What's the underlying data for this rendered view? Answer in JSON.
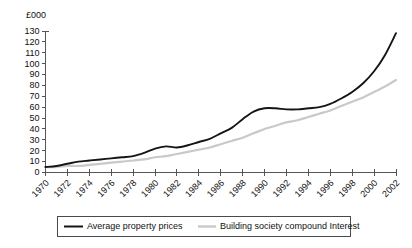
{
  "chart_data": {
    "type": "line",
    "title": "",
    "subtitle": "",
    "xlabel": "",
    "ylabel": "",
    "unit_label": "£000",
    "grid": false,
    "legend_position": "bottom",
    "xlim": [
      1970,
      2002
    ],
    "ylim": [
      0,
      130
    ],
    "ytick_step": 10,
    "xtick_step": 2,
    "x": [
      1970,
      1971,
      1972,
      1973,
      1974,
      1975,
      1976,
      1977,
      1978,
      1979,
      1980,
      1981,
      1982,
      1983,
      1984,
      1985,
      1986,
      1987,
      1988,
      1989,
      1990,
      1991,
      1992,
      1993,
      1994,
      1995,
      1996,
      1997,
      1998,
      1999,
      2000,
      2001,
      2002
    ],
    "xticks": [
      "1970",
      "1972",
      "1974",
      "1976",
      "1978",
      "1980",
      "1982",
      "1984",
      "1986",
      "1988",
      "1990",
      "1992",
      "1994",
      "1996",
      "1998",
      "2000",
      "2002"
    ],
    "yticks": [
      "0",
      "10",
      "20",
      "30",
      "40",
      "50",
      "60",
      "70",
      "80",
      "90",
      "100",
      "110",
      "120",
      "130"
    ],
    "series": [
      {
        "name": "Average property prices",
        "color": "#151515",
        "values": [
          5,
          6,
          8,
          10,
          11,
          12,
          13,
          14,
          15,
          18,
          22,
          24,
          23,
          25,
          28,
          31,
          36,
          41,
          49,
          56,
          59,
          59,
          58,
          58,
          59,
          60,
          63,
          68,
          74,
          82,
          93,
          108,
          128
        ]
      },
      {
        "name": "Building society compound Interest",
        "color": "#c9c9c9",
        "values": [
          5,
          5,
          6,
          6,
          7,
          8,
          9,
          10,
          11,
          12,
          14,
          15,
          17,
          19,
          21,
          23,
          26,
          29,
          32,
          36,
          40,
          43,
          46,
          48,
          51,
          54,
          57,
          61,
          65,
          69,
          74,
          79,
          85
        ]
      }
    ]
  },
  "legend": {
    "items": [
      {
        "label": "Average property prices",
        "color": "#151515"
      },
      {
        "label": "Building society compound Interest",
        "color": "#c9c9c9"
      }
    ]
  }
}
